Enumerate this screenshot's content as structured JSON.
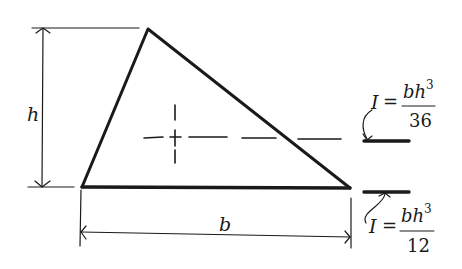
{
  "diagram": {
    "labels": {
      "height": "h",
      "base": "b"
    },
    "formulas": {
      "centroidal": {
        "lhs": "I",
        "eq": "=",
        "numerator_base": "bh",
        "numerator_exp": "3",
        "denominator": "36",
        "axis": "centroidal axis (dashed line through centroid)"
      },
      "base": {
        "lhs": "I",
        "eq": "=",
        "numerator_base": "bh",
        "numerator_exp": "3",
        "denominator": "12",
        "axis": "base axis"
      }
    },
    "colors": {
      "ink": "#1a1a1a",
      "background": "#ffffff"
    }
  }
}
